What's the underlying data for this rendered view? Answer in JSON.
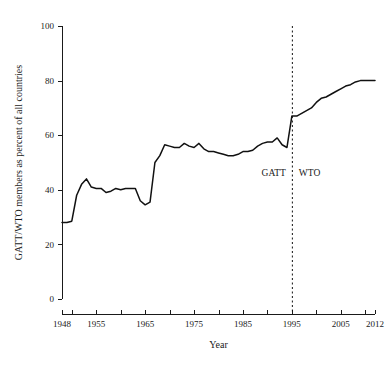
{
  "chart_data": {
    "type": "line",
    "title": "",
    "subtitle": "",
    "xlabel": "Year",
    "ylabel": "GATT/WTO members as percent of all countries",
    "xlim": [
      1948,
      2012
    ],
    "ylim": [
      0,
      100
    ],
    "grid": false,
    "legend": "none",
    "x_ticks": [
      1948,
      1950,
      1955,
      1960,
      1965,
      1970,
      1975,
      1980,
      1985,
      1990,
      1995,
      2000,
      2005,
      2010,
      2012
    ],
    "x_tick_labels": [
      "1948",
      "",
      "1955",
      "",
      "1965",
      "",
      "1975",
      "",
      "1985",
      "",
      "1995",
      "",
      "2005",
      "",
      "2012"
    ],
    "y_ticks": [
      0,
      20,
      40,
      60,
      80,
      100
    ],
    "y_tick_labels": [
      "0",
      "20",
      "40",
      "60",
      "80",
      "100"
    ],
    "line_color": "#111111",
    "series": [
      {
        "name": "GATT/WTO members as percent of all countries",
        "x": [
          1948,
          1949,
          1950,
          1951,
          1952,
          1953,
          1954,
          1955,
          1956,
          1957,
          1958,
          1959,
          1960,
          1961,
          1962,
          1963,
          1964,
          1965,
          1966,
          1967,
          1968,
          1969,
          1970,
          1971,
          1972,
          1973,
          1974,
          1975,
          1976,
          1977,
          1978,
          1979,
          1980,
          1981,
          1982,
          1983,
          1984,
          1985,
          1986,
          1987,
          1988,
          1989,
          1990,
          1991,
          1992,
          1993,
          1994,
          1995,
          1996,
          1997,
          1998,
          1999,
          2000,
          2001,
          2002,
          2003,
          2004,
          2005,
          2006,
          2007,
          2008,
          2009,
          2010,
          2011,
          2012
        ],
        "y": [
          28,
          28,
          28.5,
          38,
          42,
          44,
          41,
          40.5,
          40.5,
          39,
          39.5,
          40.5,
          40,
          40.5,
          40.5,
          40.5,
          36,
          34.5,
          35.5,
          50,
          52.5,
          56.5,
          56,
          55.5,
          55.5,
          57,
          56,
          55.5,
          57,
          55,
          54,
          54,
          53.5,
          53,
          52.5,
          52.5,
          53,
          54,
          54,
          54.5,
          56,
          57,
          57.5,
          57.5,
          59,
          56.5,
          55.5,
          67,
          67,
          68,
          69,
          70,
          72,
          73.5,
          74,
          75,
          76,
          77,
          78,
          78.5,
          79.5,
          80,
          80,
          80,
          80
        ]
      }
    ],
    "annotations": [
      {
        "name": "gatt-label",
        "text": "GATT",
        "x": 1995,
        "y": 45,
        "side": "left"
      },
      {
        "name": "wto-label",
        "text": "WTO",
        "x": 1995,
        "y": 45,
        "side": "right"
      }
    ],
    "event_line": {
      "name": "wto-founding-line",
      "x": 1995,
      "style": "dashed"
    }
  }
}
